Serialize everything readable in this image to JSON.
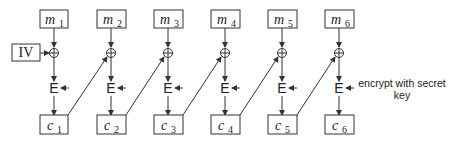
{
  "diagram": {
    "iv_label": "IV",
    "cipher_op_label": "E",
    "key_note_line1": "encrypt with secret",
    "key_note_line2": "key",
    "colors": {
      "stroke": "#333333",
      "text": "#222222",
      "background": "#ffffff"
    },
    "blocks": [
      {
        "m": "m",
        "m_sub": "1",
        "c": "c",
        "c_sub": "1"
      },
      {
        "m": "m",
        "m_sub": "2",
        "c": "c",
        "c_sub": "2"
      },
      {
        "m": "m",
        "m_sub": "3",
        "c": "c",
        "c_sub": "3"
      },
      {
        "m": "m",
        "m_sub": "4",
        "c": "c",
        "c_sub": "4"
      },
      {
        "m": "m",
        "m_sub": "5",
        "c": "c",
        "c_sub": "5"
      },
      {
        "m": "m",
        "m_sub": "6",
        "c": "c",
        "c_sub": "6"
      }
    ]
  }
}
